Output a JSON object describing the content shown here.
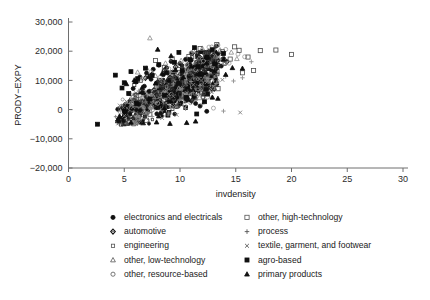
{
  "chart_data": {
    "type": "scatter",
    "title": "",
    "xlabel": "invdensity",
    "ylabel": "PRODY−EXPY",
    "xlim": [
      0,
      30
    ],
    "ylim": [
      -20000,
      30000
    ],
    "xticks": [
      0,
      5,
      10,
      15,
      20,
      25,
      30
    ],
    "xticklabels": [
      "0",
      "5",
      "10",
      "15",
      "20",
      "25",
      "30"
    ],
    "yticks": [
      -20000,
      -10000,
      0,
      10000,
      20000,
      30000
    ],
    "yticklabels": [
      "−20,000",
      "−10,000",
      "0",
      "10,000",
      "20,000",
      "30,000"
    ],
    "grid": false,
    "legend_position": "below-plot",
    "series": [
      {
        "name": "electronics and electricals",
        "marker": "filled-circle",
        "color": "#111111",
        "points": [
          [
            6.1,
            9500
          ],
          [
            6.4,
            11200
          ],
          [
            6.8,
            8000
          ],
          [
            7.0,
            12500
          ],
          [
            7.2,
            6200
          ],
          [
            7.4,
            10400
          ],
          [
            7.6,
            13800
          ],
          [
            7.9,
            9100
          ],
          [
            8.1,
            15200
          ],
          [
            8.3,
            7400
          ],
          [
            8.5,
            11900
          ],
          [
            8.8,
            14300
          ],
          [
            9.0,
            10100
          ],
          [
            9.2,
            16500
          ],
          [
            9.5,
            12800
          ],
          [
            9.7,
            8600
          ],
          [
            10.0,
            15800
          ],
          [
            10.2,
            13100
          ],
          [
            10.5,
            17200
          ],
          [
            10.8,
            11400
          ],
          [
            11.0,
            16900
          ],
          [
            11.3,
            14700
          ],
          [
            11.6,
            18400
          ],
          [
            11.9,
            12200
          ],
          [
            12.2,
            15500
          ],
          [
            12.5,
            17800
          ],
          [
            12.8,
            13600
          ],
          [
            13.1,
            16200
          ],
          [
            13.4,
            19100
          ],
          [
            13.7,
            14900
          ],
          [
            11.4,
            2100
          ],
          [
            11.8,
            1200
          ],
          [
            12.4,
            -600
          ],
          [
            10.6,
            3400
          ],
          [
            9.4,
            4200
          ],
          [
            8.2,
            3100
          ],
          [
            7.1,
            2500
          ],
          [
            6.3,
            1800
          ],
          [
            13.9,
            17500
          ],
          [
            12.0,
            19800
          ],
          [
            10.4,
            6800
          ],
          [
            9.8,
            5400
          ],
          [
            5.8,
            7200
          ],
          [
            6.6,
            5900
          ]
        ]
      },
      {
        "name": "automotive",
        "marker": "diamond",
        "color": "#222222",
        "points": [
          [
            6.9,
            10800
          ],
          [
            7.5,
            12100
          ],
          [
            8.0,
            9400
          ],
          [
            8.6,
            13500
          ],
          [
            9.1,
            11000
          ],
          [
            9.6,
            14600
          ],
          [
            10.1,
            12400
          ],
          [
            10.7,
            15300
          ],
          [
            11.2,
            13200
          ],
          [
            11.7,
            16100
          ],
          [
            12.3,
            14000
          ],
          [
            12.9,
            17000
          ],
          [
            13.5,
            15100
          ],
          [
            13.0,
            18600
          ],
          [
            11.5,
            19300
          ],
          [
            10.3,
            8200
          ],
          [
            9.3,
            6900
          ],
          [
            8.4,
            7800
          ],
          [
            7.7,
            5600
          ],
          [
            7.0,
            4300
          ],
          [
            12.6,
            19900
          ],
          [
            14.2,
            16400
          ]
        ]
      },
      {
        "name": "engineering",
        "marker": "small-square",
        "color": "#333333",
        "points": [
          [
            5.9,
            8400
          ],
          [
            6.5,
            9900
          ],
          [
            7.3,
            11500
          ],
          [
            8.1,
            10200
          ],
          [
            8.9,
            12700
          ],
          [
            9.5,
            11100
          ],
          [
            10.2,
            13900
          ],
          [
            10.9,
            12300
          ],
          [
            11.6,
            15000
          ],
          [
            12.2,
            13400
          ],
          [
            12.8,
            16300
          ],
          [
            13.3,
            14500
          ],
          [
            13.8,
            17100
          ],
          [
            11.1,
            17900
          ],
          [
            10.0,
            5200
          ],
          [
            9.0,
            4000
          ],
          [
            8.3,
            6100
          ],
          [
            7.4,
            3700
          ],
          [
            6.7,
            2900
          ],
          [
            14.0,
            15700
          ],
          [
            12.5,
            18800
          ],
          [
            6.0,
            5100
          ]
        ]
      },
      {
        "name": "other, low-technology",
        "marker": "open-triangle",
        "color": "#8a8a8a",
        "points": [
          [
            7.3,
            24500
          ],
          [
            6.2,
            12800
          ],
          [
            7.0,
            14200
          ],
          [
            7.8,
            11600
          ],
          [
            8.7,
            15900
          ],
          [
            9.4,
            13300
          ],
          [
            10.1,
            16800
          ],
          [
            10.9,
            14100
          ],
          [
            11.7,
            17600
          ],
          [
            12.4,
            15200
          ],
          [
            13.2,
            18200
          ],
          [
            14.0,
            16000
          ],
          [
            14.6,
            19600
          ],
          [
            13.6,
            20400
          ],
          [
            12.0,
            21000
          ],
          [
            9.9,
            7300
          ],
          [
            8.5,
            5800
          ],
          [
            7.6,
            4400
          ],
          [
            6.8,
            3200
          ],
          [
            15.1,
            17400
          ],
          [
            11.2,
            20100
          ]
        ]
      },
      {
        "name": "other, resource-based",
        "marker": "open-circle",
        "color": "#9a9a9a",
        "points": [
          [
            6.6,
            10500
          ],
          [
            7.4,
            12900
          ],
          [
            8.2,
            11000
          ],
          [
            9.0,
            14000
          ],
          [
            9.8,
            12200
          ],
          [
            10.6,
            15400
          ],
          [
            11.4,
            13700
          ],
          [
            12.1,
            16600
          ],
          [
            12.9,
            14800
          ],
          [
            13.7,
            17900
          ],
          [
            14.4,
            15900
          ],
          [
            15.2,
            19000
          ],
          [
            14.1,
            20600
          ],
          [
            12.6,
            21400
          ],
          [
            11.0,
            19400
          ],
          [
            10.4,
            1400
          ],
          [
            9.2,
            800
          ],
          [
            8.0,
            2200
          ],
          [
            13.0,
            500
          ],
          [
            15.8,
            18100
          ],
          [
            13.4,
            22100
          ]
        ]
      },
      {
        "name": "other, high-technology",
        "marker": "open-square",
        "color": "#4a4a4a",
        "points": [
          [
            7.8,
            16800
          ],
          [
            8.6,
            14400
          ],
          [
            9.3,
            17400
          ],
          [
            10.0,
            15100
          ],
          [
            10.8,
            18200
          ],
          [
            11.5,
            16000
          ],
          [
            12.3,
            19000
          ],
          [
            13.0,
            16700
          ],
          [
            13.8,
            19800
          ],
          [
            14.5,
            17300
          ],
          [
            15.3,
            20300
          ],
          [
            16.1,
            18000
          ],
          [
            14.9,
            21500
          ],
          [
            13.3,
            22300
          ],
          [
            11.8,
            20900
          ],
          [
            17.2,
            20200
          ],
          [
            18.6,
            20400
          ],
          [
            16.6,
            13400
          ],
          [
            20.0,
            18900
          ],
          [
            10.4,
            9100
          ],
          [
            9.1,
            10300
          ],
          [
            8.3,
            8500
          ],
          [
            12.8,
            11200
          ],
          [
            15.6,
            12600
          ],
          [
            11.9,
            7600
          ]
        ]
      },
      {
        "name": "process",
        "marker": "plus",
        "color": "#8f8f8f",
        "points": [
          [
            5.6,
            4800
          ],
          [
            6.3,
            6400
          ],
          [
            7.1,
            5100
          ],
          [
            7.9,
            7700
          ],
          [
            8.7,
            6000
          ],
          [
            9.4,
            8800
          ],
          [
            10.2,
            7100
          ],
          [
            11.0,
            9600
          ],
          [
            11.8,
            8200
          ],
          [
            12.5,
            10600
          ],
          [
            13.3,
            9000
          ],
          [
            14.1,
            11400
          ],
          [
            14.8,
            9800
          ],
          [
            12.0,
            1900
          ],
          [
            10.5,
            300
          ],
          [
            9.0,
            -1200
          ],
          [
            7.5,
            -2400
          ],
          [
            6.4,
            -3300
          ],
          [
            15.6,
            10900
          ],
          [
            13.9,
            -500
          ],
          [
            16.4,
            16400
          ]
        ]
      },
      {
        "name": "textile, garment, and footwear",
        "marker": "cross",
        "color": "#7d7d7d",
        "points": [
          [
            4.6,
            1400
          ],
          [
            5.2,
            2800
          ],
          [
            5.8,
            900
          ],
          [
            6.4,
            4100
          ],
          [
            7.0,
            2300
          ],
          [
            7.6,
            5200
          ],
          [
            8.2,
            3400
          ],
          [
            8.8,
            6300
          ],
          [
            9.4,
            4600
          ],
          [
            10.0,
            7400
          ],
          [
            10.6,
            5700
          ],
          [
            11.2,
            8500
          ],
          [
            11.8,
            6800
          ],
          [
            12.4,
            9400
          ],
          [
            13.0,
            7900
          ],
          [
            9.7,
            -1800
          ],
          [
            8.4,
            -2900
          ],
          [
            7.2,
            -3800
          ],
          [
            6.0,
            -4200
          ],
          [
            13.8,
            10200
          ],
          [
            15.4,
            -1000
          ],
          [
            5.0,
            -2100
          ]
        ]
      },
      {
        "name": "agro-based",
        "marker": "filled-square",
        "color": "#0d0d0d",
        "points": [
          [
            2.6,
            -5000
          ],
          [
            4.2,
            11800
          ],
          [
            5.0,
            9200
          ],
          [
            5.6,
            13000
          ],
          [
            6.2,
            10600
          ],
          [
            6.9,
            14200
          ],
          [
            7.5,
            11700
          ],
          [
            8.1,
            15400
          ],
          [
            8.8,
            12600
          ],
          [
            9.5,
            16200
          ],
          [
            10.2,
            13500
          ],
          [
            10.9,
            17100
          ],
          [
            11.6,
            14700
          ],
          [
            12.4,
            18000
          ],
          [
            13.1,
            15600
          ],
          [
            13.9,
            19200
          ],
          [
            12.9,
            20500
          ],
          [
            11.3,
            21200
          ],
          [
            9.9,
            19600
          ],
          [
            8.6,
            4900
          ],
          [
            7.3,
            3600
          ],
          [
            6.1,
            2100
          ],
          [
            12.2,
            2700
          ],
          [
            11.5,
            -1500
          ],
          [
            5.4,
            5500
          ],
          [
            4.8,
            7400
          ]
        ]
      },
      {
        "name": "primary products",
        "marker": "filled-triangle",
        "color": "#0d0d0d",
        "points": [
          [
            5.2,
            8800
          ],
          [
            5.9,
            10100
          ],
          [
            6.6,
            7500
          ],
          [
            7.2,
            11300
          ],
          [
            7.8,
            9000
          ],
          [
            8.4,
            12400
          ],
          [
            9.0,
            10000
          ],
          [
            9.6,
            13600
          ],
          [
            10.3,
            11100
          ],
          [
            11.0,
            14800
          ],
          [
            11.7,
            12100
          ],
          [
            12.4,
            16000
          ],
          [
            13.1,
            13200
          ],
          [
            13.9,
            17200
          ],
          [
            14.7,
            14300
          ],
          [
            8.0,
            20600
          ],
          [
            9.2,
            18400
          ],
          [
            10.6,
            -4500
          ],
          [
            9.1,
            -4800
          ],
          [
            7.9,
            -4300
          ],
          [
            6.7,
            -4600
          ],
          [
            11.4,
            -4000
          ],
          [
            12.9,
            4200
          ],
          [
            14.1,
            12000
          ],
          [
            6.0,
            9600
          ],
          [
            15.6,
            14100
          ],
          [
            5.6,
            -4400
          ],
          [
            13.4,
            3800
          ]
        ]
      }
    ]
  },
  "legend": {
    "columns": [
      {
        "items": [
          {
            "label": "electronics and electricals",
            "marker": "filled-circle"
          },
          {
            "label": "automotive",
            "marker": "diamond"
          },
          {
            "label": "engineering",
            "marker": "small-square"
          },
          {
            "label": "other, low-technology",
            "marker": "open-triangle"
          },
          {
            "label": "other, resource-based",
            "marker": "open-circle"
          }
        ]
      },
      {
        "items": [
          {
            "label": "other, high-technology",
            "marker": "open-square"
          },
          {
            "label": "process",
            "marker": "plus"
          },
          {
            "label": "textile, garment, and footwear",
            "marker": "cross"
          },
          {
            "label": "agro-based",
            "marker": "filled-square"
          },
          {
            "label": "primary products",
            "marker": "filled-triangle"
          }
        ]
      }
    ]
  }
}
